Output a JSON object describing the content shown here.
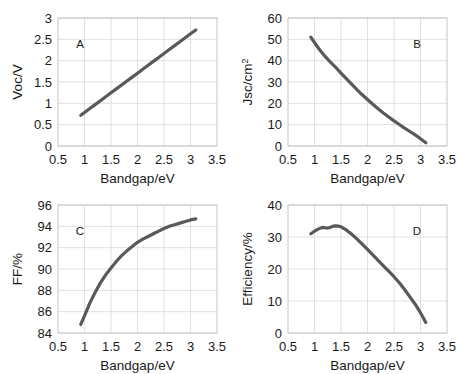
{
  "figure": {
    "background": "#ffffff",
    "curve_color": "#595959",
    "grid_color": "#d9d9d9",
    "border_color": "#bfbfbf",
    "text_color": "#1a1a1a"
  },
  "chart_data": [
    {
      "type": "line",
      "panel_label": "A",
      "panel_label_position": "top-left",
      "title": "",
      "xlabel": "Bandgap/eV",
      "ylabel": "Voc/V",
      "ylabel_parts": [
        "Voc/V"
      ],
      "xlim": [
        0.5,
        3.5
      ],
      "ylim": [
        0,
        3
      ],
      "xticks": [
        "0.5",
        "1",
        "1.5",
        "2",
        "2.5",
        "3",
        "3.5"
      ],
      "yticks": [
        "0",
        "0.5",
        "1",
        "1.5",
        "2",
        "2.5",
        "3"
      ],
      "xtick_values": [
        0.5,
        1,
        1.5,
        2,
        2.5,
        3,
        3.5
      ],
      "ytick_values": [
        0,
        0.5,
        1,
        1.5,
        2,
        2.5,
        3
      ],
      "grid": true,
      "legend": "none",
      "x": [
        0.93,
        1.0,
        1.1,
        1.2,
        1.3,
        1.4,
        1.5,
        1.6,
        1.7,
        1.8,
        1.9,
        2.0,
        2.1,
        2.2,
        2.3,
        2.4,
        2.5,
        2.6,
        2.7,
        2.8,
        2.9,
        3.0,
        3.1
      ],
      "y": [
        0.72,
        0.785,
        0.877,
        0.969,
        1.061,
        1.153,
        1.246,
        1.338,
        1.43,
        1.522,
        1.614,
        1.707,
        1.799,
        1.891,
        1.983,
        2.075,
        2.168,
        2.26,
        2.352,
        2.444,
        2.536,
        2.629,
        2.72
      ]
    },
    {
      "type": "line",
      "panel_label": "B",
      "panel_label_position": "top-right",
      "title": "",
      "xlabel": "Bandgap/eV",
      "ylabel": "Jsc/cm2",
      "ylabel_parts": [
        "Jsc/cm",
        "2"
      ],
      "xlim": [
        0.5,
        3.5
      ],
      "ylim": [
        0,
        60
      ],
      "xticks": [
        "0.5",
        "1",
        "1.5",
        "2",
        "2.5",
        "3",
        "3.5"
      ],
      "yticks": [
        "0",
        "10",
        "20",
        "30",
        "40",
        "50",
        "60"
      ],
      "xtick_values": [
        0.5,
        1,
        1.5,
        2,
        2.5,
        3,
        3.5
      ],
      "ytick_values": [
        0,
        10,
        20,
        30,
        40,
        50,
        60
      ],
      "grid": true,
      "legend": "none",
      "x": [
        0.93,
        1.0,
        1.1,
        1.2,
        1.3,
        1.4,
        1.5,
        1.6,
        1.7,
        1.8,
        1.9,
        2.0,
        2.1,
        2.2,
        2.3,
        2.4,
        2.5,
        2.6,
        2.7,
        2.8,
        2.9,
        3.0,
        3.1
      ],
      "y": [
        51.0,
        48.5,
        45.0,
        42.0,
        39.3,
        36.8,
        34.2,
        31.6,
        29.0,
        26.4,
        24.0,
        21.8,
        19.6,
        17.5,
        15.5,
        13.6,
        11.8,
        10.1,
        8.4,
        6.8,
        5.2,
        3.4,
        1.5
      ]
    },
    {
      "type": "line",
      "panel_label": "C",
      "panel_label_position": "top-left",
      "title": "",
      "xlabel": "Bandgap/eV",
      "ylabel": "FF/%",
      "ylabel_parts": [
        "FF/%"
      ],
      "xlim": [
        0.5,
        3.5
      ],
      "ylim": [
        84,
        96
      ],
      "xticks": [
        "0.5",
        "1",
        "1.5",
        "2",
        "2.5",
        "3",
        "3.5"
      ],
      "yticks": [
        "84",
        "86",
        "88",
        "90",
        "92",
        "94",
        "96"
      ],
      "xtick_values": [
        0.5,
        1,
        1.5,
        2,
        2.5,
        3,
        3.5
      ],
      "ytick_values": [
        84,
        86,
        88,
        90,
        92,
        94,
        96
      ],
      "grid": true,
      "legend": "none",
      "x": [
        0.93,
        1.0,
        1.1,
        1.2,
        1.3,
        1.4,
        1.5,
        1.6,
        1.7,
        1.8,
        1.9,
        2.0,
        2.1,
        2.2,
        2.3,
        2.4,
        2.5,
        2.6,
        2.7,
        2.8,
        2.9,
        3.0,
        3.1
      ],
      "y": [
        84.8,
        85.6,
        86.8,
        87.8,
        88.7,
        89.45,
        90.1,
        90.7,
        91.25,
        91.7,
        92.1,
        92.5,
        92.8,
        93.05,
        93.3,
        93.55,
        93.8,
        94.0,
        94.15,
        94.3,
        94.45,
        94.6,
        94.7
      ]
    },
    {
      "type": "line",
      "panel_label": "D",
      "panel_label_position": "top-right",
      "title": "",
      "xlabel": "Bandgap/eV",
      "ylabel": "Efficiency/%",
      "ylabel_parts": [
        "Efficiency/%"
      ],
      "xlim": [
        0.5,
        3.5
      ],
      "ylim": [
        0,
        40
      ],
      "xticks": [
        "0.5",
        "1",
        "1.5",
        "2",
        "2.5",
        "3",
        "3.5"
      ],
      "yticks": [
        "0",
        "10",
        "20",
        "30",
        "40"
      ],
      "xtick_values": [
        0.5,
        1,
        1.5,
        2,
        2.5,
        3,
        3.5
      ],
      "ytick_values": [
        0,
        10,
        20,
        30,
        40
      ],
      "grid": true,
      "legend": "none",
      "x": [
        0.93,
        1.0,
        1.05,
        1.1,
        1.15,
        1.2,
        1.25,
        1.3,
        1.35,
        1.4,
        1.45,
        1.5,
        1.6,
        1.7,
        1.8,
        1.9,
        2.0,
        2.1,
        2.2,
        2.3,
        2.4,
        2.5,
        2.6,
        2.7,
        2.8,
        2.9,
        3.0,
        3.1
      ],
      "y": [
        31.0,
        31.8,
        32.3,
        32.7,
        33.0,
        32.9,
        32.8,
        33.0,
        33.4,
        33.5,
        33.4,
        33.2,
        32.2,
        30.9,
        29.4,
        27.8,
        26.1,
        24.4,
        22.7,
        21.0,
        19.3,
        17.6,
        15.7,
        13.6,
        11.3,
        9.0,
        6.3,
        3.3
      ]
    }
  ]
}
